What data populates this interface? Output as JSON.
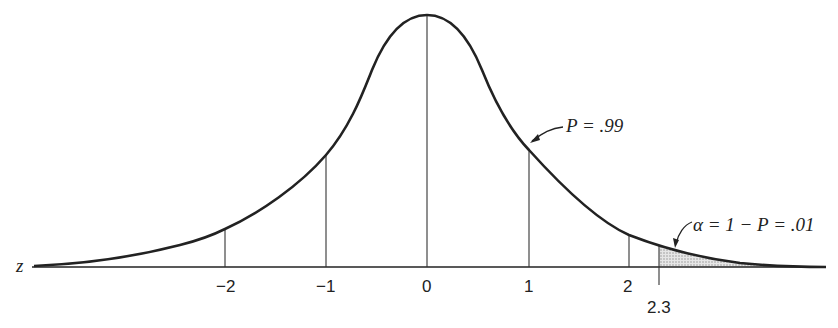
{
  "diagram": {
    "title": "",
    "type": "normal-distribution-curve",
    "axis_label": "z",
    "ticks": [
      {
        "label": "−2",
        "z": -2
      },
      {
        "label": "−1",
        "z": -1
      },
      {
        "label": "0",
        "z": 0
      },
      {
        "label": "1",
        "z": 1
      },
      {
        "label": "2",
        "z": 2
      },
      {
        "label": "2.3",
        "z": 2.3
      }
    ],
    "annotations": {
      "p_label": "P = .99",
      "alpha_label": "α = 1 − P = .01"
    },
    "shaded_region": {
      "from_z": 2.3,
      "to_z": "infinity",
      "description": "upper tail area"
    },
    "colors": {
      "line": "#222222",
      "shade": "#cfcfcf",
      "background": "#ffffff"
    }
  }
}
